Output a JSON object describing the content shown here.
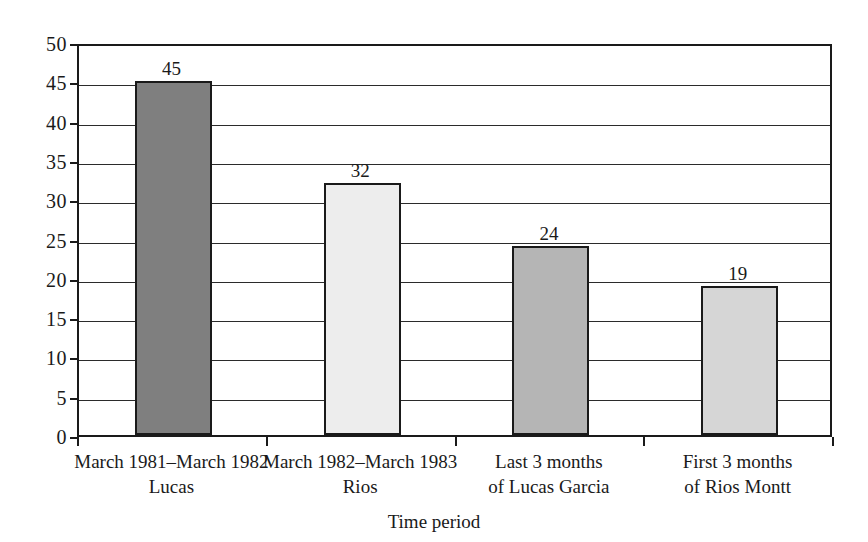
{
  "chart_data": {
    "type": "bar",
    "title": "",
    "xlabel": "Time period",
    "ylabel": "",
    "ylim": [
      0,
      50
    ],
    "ytick_step": 5,
    "yticks": [
      "50",
      "45",
      "40",
      "35",
      "30",
      "25",
      "20",
      "15",
      "10",
      "5",
      "0"
    ],
    "grid": true,
    "legend": "none",
    "categories": [
      "March 1981–March 1982",
      "March 1982–March 1983",
      "Last 3 months",
      "First 3 months"
    ],
    "category_lines2": [
      "Lucas",
      "Rios",
      "of Lucas Garcia",
      "of Rios Montt"
    ],
    "values": [
      45,
      32,
      24,
      19
    ],
    "value_labels": [
      "45",
      "32",
      "24",
      "19"
    ],
    "bar_colors": [
      "#7f7f7f",
      "#ededed",
      "#b5b5b5",
      "#d6d6d6"
    ],
    "bar_border_color": "#1a1a1a",
    "axis_color": "#1a1a1a",
    "grid_color": "#2b2b2b",
    "background": "#ffffff"
  }
}
